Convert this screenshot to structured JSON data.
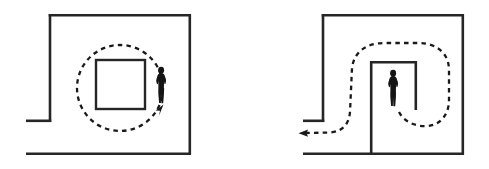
{
  "figure": {
    "title": "",
    "background_color": "#ffffff",
    "line_color": "#262626",
    "path_color": "#1a1a1a",
    "person_color": "#141414",
    "width": 489,
    "height": 169,
    "panels": [
      {
        "id": "left-panel",
        "name": "circular-path-around-central-obstacle",
        "label": "",
        "room": {
          "name": "room-outline-left",
          "description": "open-ended rectangular room with a short left stub wall",
          "walls": [
            {
              "name": "left-wall-upper",
              "points": "50,14 50,122"
            },
            {
              "name": "top-wall",
              "points": "50,14 191,14"
            },
            {
              "name": "right-wall",
              "points": "191,14 191,155"
            },
            {
              "name": "left-stub-wall",
              "points": "50,122 26,122"
            },
            {
              "name": "bottom-wall",
              "points": "26,155 191,155"
            }
          ]
        },
        "obstacle": {
          "name": "central-square-obstacle",
          "x": 96,
          "y": 60,
          "width": 49,
          "height": 49
        },
        "trajectory": {
          "name": "circular-trajectory",
          "shape": "circle",
          "center_x": 120,
          "center_y": 88,
          "radius": 43,
          "style": "dashed",
          "direction": "counter-clockwise",
          "arrow": {
            "name": "trajectory-arrow-left",
            "x": 161,
            "y": 108,
            "angle_deg": -45
          }
        },
        "person": {
          "name": "person-figure-left",
          "x": 156,
          "y": 67,
          "height": 37,
          "pose": "standing, facing viewer, hands at waist"
        }
      },
      {
        "id": "right-panel",
        "name": "u-turn-path-around-alcove",
        "label": "",
        "room": {
          "name": "room-outline-right",
          "description": "rectangular room with a deep alcove/niche opening to the bottom",
          "walls": [
            {
              "name": "left-wall-upper",
              "points": "323,14 323,122"
            },
            {
              "name": "top-wall",
              "points": "323,14 464,14"
            },
            {
              "name": "right-wall",
              "points": "464,14 464,155"
            },
            {
              "name": "left-stub-wall",
              "points": "323,122 303,122"
            },
            {
              "name": "bottom-wall",
              "points": "303,155 464,155"
            },
            {
              "name": "alcove-left-wall",
              "points": "370,61 370,155"
            },
            {
              "name": "alcove-top-wall",
              "points": "370,61 417,61"
            },
            {
              "name": "alcove-right-wall",
              "points": "417,61 417,110"
            }
          ]
        },
        "obstacle": null,
        "trajectory": {
          "name": "u-turn-trajectory",
          "shape": "u-turn-loop",
          "style": "dashed",
          "description": "starts at the person inside the alcove, loops clockwise around the alcove right wall, over the alcove top, down the left side and exits left along the bottom",
          "start_x": 398,
          "start_y": 112,
          "end_x": 300,
          "end_y": 133,
          "arrow": {
            "name": "trajectory-arrow-right",
            "x": 299,
            "y": 133,
            "angle_deg": 180
          }
        },
        "person": {
          "name": "person-figure-right",
          "x": 388,
          "y": 70,
          "height": 37,
          "pose": "standing, facing viewer, hands at waist"
        }
      }
    ]
  }
}
